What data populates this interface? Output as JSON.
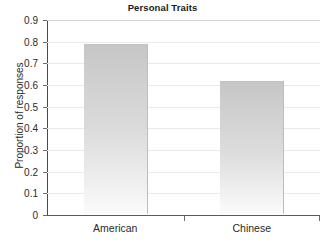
{
  "chart_data": {
    "type": "bar",
    "title": "Personal Traits",
    "xlabel": "",
    "ylabel": "Proportion of responses",
    "categories": [
      "American",
      "Chinese"
    ],
    "values": [
      0.78,
      0.61
    ],
    "ylim": [
      0,
      0.9
    ],
    "ytick_labels": [
      "0.9",
      "0.8",
      "0.7",
      "0.6",
      "0.5",
      "0.4",
      "0.3",
      "0.2",
      "0.1",
      "0"
    ],
    "ytick_values": [
      0.9,
      0.8,
      0.7,
      0.6,
      0.5,
      0.4,
      0.3,
      0.2,
      0.1,
      0
    ],
    "grid": true,
    "legend": false,
    "series": [
      {
        "name": "Proportion of responses",
        "values": [
          0.78,
          0.61
        ]
      }
    ],
    "colors": {
      "bar_top": "#c6c6c6",
      "bar_bottom": "#fbfbfb",
      "gridline": "#e9e9e9",
      "axis": "#4a4a4a",
      "text": "#2a2a2a",
      "background": "#ffffff"
    }
  }
}
